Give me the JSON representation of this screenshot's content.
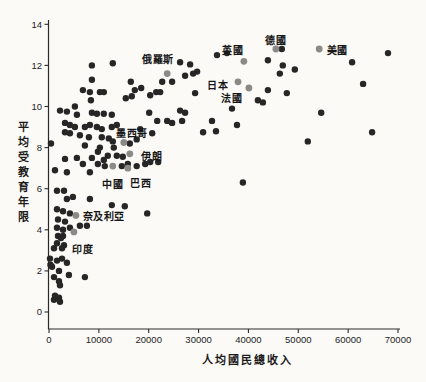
{
  "chart": {
    "xlabel": "人均國民總收入",
    "ylabel": "平均受教育年限",
    "colors": {
      "dot": "#262626",
      "highlight": "#8c8a87",
      "axis": "#2a2a2a",
      "text": "#1c1c1c",
      "background": "#fbfaf7"
    }
  },
  "chart_data": {
    "type": "scatter",
    "title": "",
    "xlabel": "人均國民總收入",
    "ylabel": "平均受教育年限",
    "xlim": [
      0,
      70000
    ],
    "ylim": [
      0,
      14
    ],
    "x_ticks": [
      0,
      10000,
      20000,
      30000,
      40000,
      50000,
      60000,
      70000
    ],
    "y_ticks": [
      0,
      2,
      4,
      6,
      8,
      10,
      12,
      14
    ],
    "grid": false,
    "legend": false,
    "labeled_points": [
      {
        "name": "俄羅斯",
        "x": 23700,
        "y": 11.6,
        "dx": -9,
        "dy": -16
      },
      {
        "name": "英國",
        "x": 39100,
        "y": 12.2,
        "dx": -11,
        "dy": -12
      },
      {
        "name": "德國",
        "x": 45500,
        "y": 12.8,
        "dx": 0,
        "dy": -10
      },
      {
        "name": "美國",
        "x": 54200,
        "y": 12.8,
        "dx": 18,
        "dy": 0
      },
      {
        "name": "日本",
        "x": 37900,
        "y": 11.2,
        "dx": -20,
        "dy": 2
      },
      {
        "name": "法國",
        "x": 40100,
        "y": 10.9,
        "dx": -17,
        "dy": 9
      },
      {
        "name": "墨西哥",
        "x": 15000,
        "y": 8.25,
        "dx": 8,
        "dy": -10
      },
      {
        "name": "伊朗",
        "x": 16200,
        "y": 7.7,
        "dx": 22,
        "dy": 1
      },
      {
        "name": "中國",
        "x": 12800,
        "y": 7.1,
        "dx": 0,
        "dy": 17
      },
      {
        "name": "巴西",
        "x": 15800,
        "y": 7.0,
        "dx": 13,
        "dy": 14
      },
      {
        "name": "奈及利亞",
        "x": 5400,
        "y": 4.7,
        "dx": 28,
        "dy": 0
      },
      {
        "name": "印度",
        "x": 5000,
        "y": 3.9,
        "dx": 9,
        "dy": 16
      }
    ],
    "points": [
      [
        8600,
        12.0
      ],
      [
        12800,
        12.1
      ],
      [
        26300,
        12.15
      ],
      [
        28300,
        12.05
      ],
      [
        33700,
        12.5
      ],
      [
        35700,
        12.6
      ],
      [
        43900,
        12.25
      ],
      [
        46700,
        12.8
      ],
      [
        46900,
        12.0
      ],
      [
        49300,
        11.8
      ],
      [
        46300,
        11.6
      ],
      [
        60800,
        12.15
      ],
      [
        68000,
        12.6
      ],
      [
        8600,
        11.3
      ],
      [
        16400,
        11.2
      ],
      [
        18500,
        10.9
      ],
      [
        17200,
        10.8
      ],
      [
        15400,
        10.4
      ],
      [
        16600,
        10.5
      ],
      [
        20300,
        10.55
      ],
      [
        21500,
        10.7
      ],
      [
        22700,
        11.2
      ],
      [
        24700,
        11.2
      ],
      [
        22300,
        10.7
      ],
      [
        27300,
        11.5
      ],
      [
        28900,
        11.6
      ],
      [
        29700,
        11.7
      ],
      [
        29300,
        10.65
      ],
      [
        26300,
        9.8
      ],
      [
        27300,
        9.7
      ],
      [
        23700,
        9.3
      ],
      [
        24700,
        9.2
      ],
      [
        26700,
        9.3
      ],
      [
        32700,
        9.3
      ],
      [
        36700,
        9.9
      ],
      [
        37700,
        9.1
      ],
      [
        41900,
        10.3
      ],
      [
        42900,
        10.2
      ],
      [
        43900,
        10.8
      ],
      [
        47700,
        10.65
      ],
      [
        54600,
        9.7
      ],
      [
        63000,
        11.1
      ],
      [
        64800,
        8.75
      ],
      [
        51900,
        8.3
      ],
      [
        30900,
        8.75
      ],
      [
        33500,
        8.8
      ],
      [
        6800,
        10.8
      ],
      [
        8200,
        10.7
      ],
      [
        10200,
        10.7
      ],
      [
        11000,
        10.7
      ],
      [
        8400,
        10.3
      ],
      [
        5200,
        10.0
      ],
      [
        2200,
        9.8
      ],
      [
        3600,
        9.75
      ],
      [
        8600,
        9.7
      ],
      [
        9600,
        9.65
      ],
      [
        11000,
        9.65
      ],
      [
        12600,
        9.6
      ],
      [
        5600,
        9.6
      ],
      [
        20100,
        9.7
      ],
      [
        21700,
        9.3
      ],
      [
        3200,
        9.2
      ],
      [
        4200,
        9.1
      ],
      [
        5200,
        9.0
      ],
      [
        7200,
        9.0
      ],
      [
        8200,
        9.1
      ],
      [
        9600,
        9.0
      ],
      [
        10600,
        8.9
      ],
      [
        12600,
        9.0
      ],
      [
        13600,
        9.1
      ],
      [
        3200,
        8.75
      ],
      [
        4200,
        8.7
      ],
      [
        6200,
        8.6
      ],
      [
        8000,
        8.5
      ],
      [
        10600,
        8.5
      ],
      [
        12000,
        8.45
      ],
      [
        18300,
        8.9
      ],
      [
        20700,
        8.7
      ],
      [
        400,
        8.2
      ],
      [
        7200,
        8.1
      ],
      [
        10200,
        8.0
      ],
      [
        13000,
        8.0
      ],
      [
        12800,
        8.3
      ],
      [
        16200,
        8.2
      ],
      [
        17600,
        8.4
      ],
      [
        5600,
        7.5
      ],
      [
        8600,
        7.5
      ],
      [
        11000,
        7.4
      ],
      [
        3200,
        7.45
      ],
      [
        9800,
        7.8
      ],
      [
        11800,
        7.6
      ],
      [
        13600,
        7.6
      ],
      [
        14800,
        7.55
      ],
      [
        9800,
        7.2
      ],
      [
        11200,
        7.1
      ],
      [
        14600,
        7.1
      ],
      [
        15800,
        7.2
      ],
      [
        17600,
        7.1
      ],
      [
        19300,
        7.2
      ],
      [
        20300,
        7.3
      ],
      [
        21900,
        7.3
      ],
      [
        6800,
        7.2
      ],
      [
        1200,
        6.9
      ],
      [
        3600,
        6.8
      ],
      [
        8200,
        6.8
      ],
      [
        38900,
        6.3
      ],
      [
        1600,
        5.9
      ],
      [
        3000,
        5.9
      ],
      [
        3600,
        5.5
      ],
      [
        4800,
        5.6
      ],
      [
        8200,
        5.5
      ],
      [
        12600,
        5.2
      ],
      [
        15200,
        5.15
      ],
      [
        19700,
        4.8
      ],
      [
        1600,
        5.0
      ],
      [
        2800,
        4.9
      ],
      [
        4200,
        4.8
      ],
      [
        1800,
        4.5
      ],
      [
        3200,
        4.4
      ],
      [
        1600,
        4.1
      ],
      [
        2800,
        4.0
      ],
      [
        4200,
        4.1
      ],
      [
        6200,
        4.2
      ],
      [
        7600,
        4.2
      ],
      [
        2400,
        3.6
      ],
      [
        1800,
        3.7
      ],
      [
        2800,
        3.7
      ],
      [
        1600,
        3.35
      ],
      [
        3000,
        3.25
      ],
      [
        1000,
        3.1
      ],
      [
        2600,
        3.1
      ],
      [
        200,
        2.6
      ],
      [
        1600,
        2.5
      ],
      [
        2600,
        2.6
      ],
      [
        3600,
        2.4
      ],
      [
        300,
        2.3
      ],
      [
        600,
        2.2
      ],
      [
        2000,
        2.0
      ],
      [
        4000,
        1.8
      ],
      [
        7200,
        1.7
      ],
      [
        1000,
        1.7
      ],
      [
        2000,
        1.5
      ],
      [
        2200,
        1.3
      ],
      [
        1200,
        0.8
      ],
      [
        2000,
        0.7
      ],
      [
        1000,
        0.6
      ],
      [
        2200,
        0.5
      ]
    ]
  }
}
